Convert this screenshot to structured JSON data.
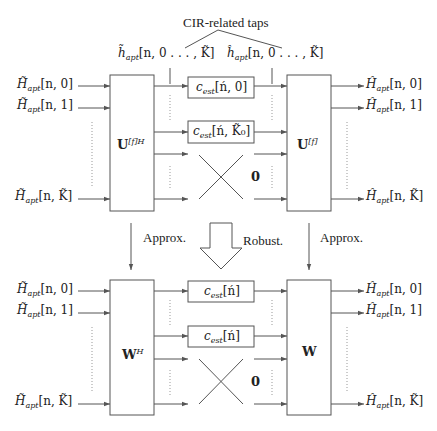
{
  "title_annotation": "CIR-related taps",
  "top": {
    "tap_labels": {
      "left": {
        "accent": "~",
        "sym": "h",
        "sub": "apt",
        "args": "[n, 0 . . . , K̃]"
      },
      "right": {
        "accent": "^",
        "sym": "h",
        "sub": "apt",
        "args": "[n, 0 . . . , K̃]"
      }
    },
    "inputs": [
      {
        "sym": "H̃",
        "sub": "apt",
        "args": "[n, 0]"
      },
      {
        "sym": "H̃",
        "sub": "apt",
        "args": "[n, 1]"
      },
      {
        "sym": "H̃",
        "sub": "apt",
        "args": "[n, K̃]"
      }
    ],
    "outputs": [
      {
        "sym": "Ĥ",
        "sub": "apt",
        "args": "[n, 0]"
      },
      {
        "sym": "Ĥ",
        "sub": "apt",
        "args": "[n, 1]"
      },
      {
        "sym": "Ĥ",
        "sub": "apt",
        "args": "[n, K̃]"
      }
    ],
    "left_block": {
      "sym": "U",
      "sup": "[f]H"
    },
    "right_block": {
      "sym": "U",
      "sup": "[f]"
    },
    "est_blocks": [
      {
        "sym": "c",
        "sub": "est",
        "args": "[ń, 0]"
      },
      {
        "sym": "c",
        "sub": "est",
        "args": "[ń, K̃₀]"
      }
    ],
    "zero_label": "0"
  },
  "transitions": {
    "left": "Approx.",
    "center": "Robust.",
    "right": "Approx."
  },
  "bottom": {
    "inputs": [
      {
        "sym": "H̃",
        "sub": "apt",
        "args": "[n, 0]"
      },
      {
        "sym": "H̃",
        "sub": "apt",
        "args": "[n, 1]"
      },
      {
        "sym": "H̃",
        "sub": "apt",
        "args": "[n, K̃]"
      }
    ],
    "outputs": [
      {
        "sym": "Ĥ",
        "sub": "apt",
        "args": "[n, 0]"
      },
      {
        "sym": "Ĥ",
        "sub": "apt",
        "args": "[n, 1]"
      },
      {
        "sym": "Ĥ",
        "sub": "apt",
        "args": "[n, K̃]"
      }
    ],
    "left_block": {
      "sym": "W",
      "sup": "H"
    },
    "right_block": {
      "sym": "W",
      "sup": ""
    },
    "est_blocks": [
      {
        "sym": "c",
        "sub": "est",
        "args": "[ń]"
      },
      {
        "sym": "c",
        "sub": "est",
        "args": "[ń]"
      }
    ],
    "zero_label": "0"
  },
  "colors": {
    "line": "#555555",
    "text": "#222222",
    "dotted": "#999999"
  }
}
